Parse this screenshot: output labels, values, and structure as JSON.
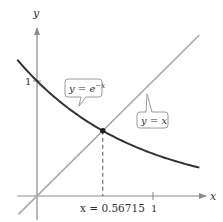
{
  "chart_data": {
    "type": "line",
    "title": "",
    "xlabel": "x",
    "ylabel": "y",
    "xlim": [
      -0.17,
      1.4
    ],
    "ylim": [
      -0.16,
      1.4
    ],
    "x_ticks": [
      {
        "value": 1,
        "label": "1"
      }
    ],
    "y_ticks": [
      {
        "value": 1,
        "label": "1"
      }
    ],
    "grid": false,
    "series": [
      {
        "name": "y = e^{-x}",
        "function": "exp(-x)",
        "x_range": [
          -0.17,
          1.4
        ],
        "color": "#333333",
        "callout": {
          "prefix": "y = e",
          "superscript": "−x",
          "anchor_x": 0.37
        }
      },
      {
        "name": "y = x",
        "function": "x",
        "x_range": [
          -0.16,
          1.4
        ],
        "color": "#a9a9a9",
        "callout": {
          "text": "y = x",
          "anchor_x": 0.95
        }
      }
    ],
    "intersection": {
      "x": 0.56715,
      "y": 0.56715,
      "label": "x = 0.56715"
    }
  }
}
